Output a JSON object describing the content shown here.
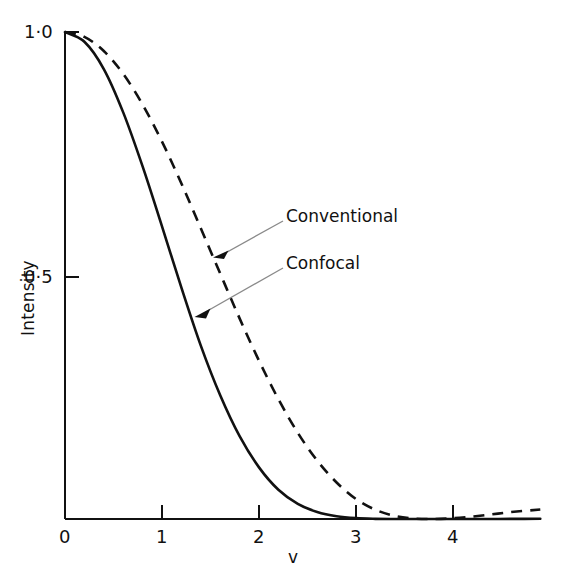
{
  "chart_data": {
    "type": "line",
    "title": "",
    "subtitle": "",
    "xlabel": "v",
    "ylabel": "Intensity",
    "xlim": [
      0,
      4.9
    ],
    "ylim": [
      0,
      1.0
    ],
    "grid": false,
    "legend_position": "inline-annotations",
    "x_ticks": [
      "0",
      "1",
      "2",
      "3",
      "4"
    ],
    "x_tick_values": [
      0,
      1,
      2,
      3,
      4
    ],
    "y_ticks": [
      "1·0",
      "0·5"
    ],
    "y_tick_values": [
      1.0,
      0.5
    ],
    "x": [
      0,
      0.2,
      0.4,
      0.6,
      0.8,
      1.0,
      1.2,
      1.4,
      1.6,
      1.8,
      2.0,
      2.2,
      2.4,
      2.6,
      2.8,
      3.0,
      3.2,
      3.4,
      3.6,
      3.8,
      4.0,
      4.2,
      4.4,
      4.6,
      4.9
    ],
    "series": [
      {
        "name": "Conventional",
        "style": "dashed",
        "color": "#111111",
        "formula": "[2*J1(v)/v]^2",
        "values": [
          1.0,
          0.99,
          0.961,
          0.914,
          0.851,
          0.775,
          0.689,
          0.597,
          0.504,
          0.412,
          0.325,
          0.246,
          0.177,
          0.12,
          0.075,
          0.041,
          0.019,
          0.0063,
          0.001,
          0.0,
          0.0015,
          0.005,
          0.0095,
          0.0142,
          0.0195
        ]
      },
      {
        "name": "Confocal",
        "style": "solid",
        "color": "#111111",
        "formula": "[2*J1(v)/v]^4",
        "values": [
          1.0,
          0.98,
          0.924,
          0.835,
          0.724,
          0.601,
          0.475,
          0.356,
          0.254,
          0.17,
          0.106,
          0.06,
          0.031,
          0.0144,
          0.0056,
          0.0017,
          0.00035,
          4e-05,
          1e-06,
          0.0,
          2e-06,
          2.5e-05,
          9e-05,
          0.0002,
          0.00038
        ]
      }
    ],
    "annotations": [
      {
        "label": "Conventional",
        "target_series": "Conventional",
        "label_x_px": 286,
        "label_y_px": 215,
        "arrow_tip_x_px": 215,
        "arrow_tip_y_px": 257
      },
      {
        "label": "Confocal",
        "target_series": "Confocal",
        "label_x_px": 286,
        "label_y_px": 262,
        "arrow_tip_x_px": 196,
        "arrow_tip_y_px": 316
      }
    ]
  },
  "axes": {
    "y_tick_1": "1·0",
    "y_tick_0_5": "0·5",
    "x_tick_0": "0",
    "x_tick_1": "1",
    "x_tick_2": "2",
    "x_tick_3": "3",
    "x_tick_4": "4",
    "x_axis_title": "v",
    "y_axis_title": "Intensity"
  },
  "annotations": {
    "conventional_label": "Conventional",
    "confocal_label": "Confocal"
  },
  "colors": {
    "background": "#ffffff",
    "ink": "#111111",
    "leader_line": "#8a8a8a"
  }
}
